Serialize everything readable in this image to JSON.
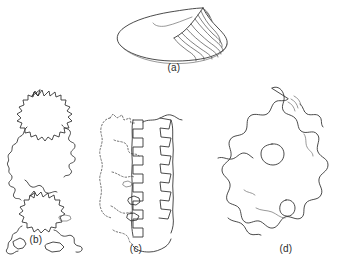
{
  "figure": {
    "kind": "scientific-line-drawing-plate",
    "background_color": "#ffffff",
    "ink_color": "#2b2b2b",
    "faint_ink_color": "#6d6d6d",
    "panel_count": 4,
    "panels": [
      {
        "id": "a",
        "label": "(a)",
        "subject": "bivalve-shell",
        "description": "Oblique view of a clam-like bivalve shell with pointed umbo at upper right and concentric growth ridges fanning down the right flank.",
        "style": "solid-outline",
        "growth_ridge_count": 8,
        "has_interior_line": true
      },
      {
        "id": "b",
        "label": "(b)",
        "subject": "crenulated-outline-tall",
        "description": "Tall irregular jagged amoeboid outline, a rounded crenulated lobe at top with a long sinuous narrow body trailing down to a second crenulated mass near the bottom.",
        "style": "solid-outline",
        "orientation": "vertical"
      },
      {
        "id": "c",
        "label": "(c)",
        "subject": "crenulated-outline-banded",
        "description": "Vertical banded pattern: a dashed/stippled outline on the left paired with two columns of solid square-wave crenulations on the right.",
        "style": "mixed-dashed-and-solid",
        "orientation": "vertical",
        "has_dashed_segments": true
      },
      {
        "id": "d",
        "label": "(d)",
        "subject": "lobed-amoeboid-outline",
        "description": "Large rounded blob with many finger-like marginal lobes; a small circular vacuole sits in the upper middle and a smaller ovoid inclusion below it.",
        "style": "solid-outline",
        "has_internal_vacuole": true,
        "internal_inclusion_count": 2
      }
    ]
  }
}
